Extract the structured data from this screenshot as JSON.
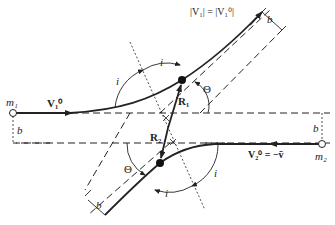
{
  "diagram": {
    "labels": {
      "m1": "m₁",
      "m2": "m₂",
      "v1_initial": "V₁⁰",
      "v2_initial": "V₂⁰ = −v̄",
      "v1_magnitude": "|V₁| = |V₁⁰|",
      "r1": "R₁",
      "r2": "R₂",
      "theta_top": "Θ",
      "theta_bottom": "Θ",
      "i_top_left": "i",
      "i_top": "i",
      "i_bottom_right": "i",
      "i_bottom": "i",
      "b_left": "b",
      "b_right": "b",
      "b_top_right": "b",
      "b_bottom_left": "b"
    },
    "colors": {
      "stroke": "#222222",
      "background": "#ffffff"
    }
  }
}
